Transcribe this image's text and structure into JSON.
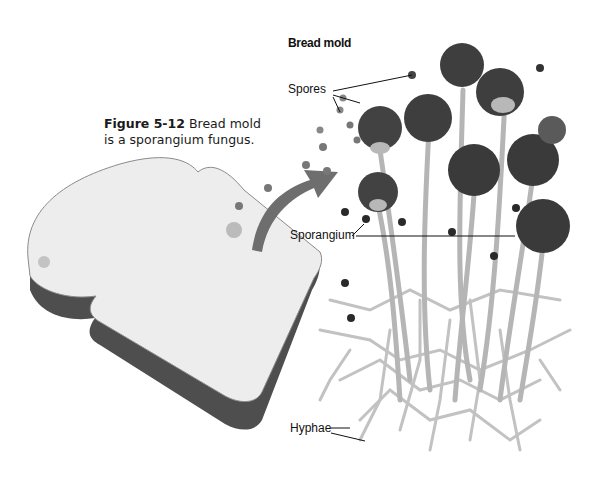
{
  "figure": {
    "number": "Figure 5-12",
    "caption": "Bread mold is a sporangium fungus.",
    "title": "Bread mold"
  },
  "labels": {
    "spores": "Spores",
    "sporangium": "Sporangium",
    "hyphae": "Hyphae"
  },
  "colors": {
    "bread_face": "#ededed",
    "crust": "#555555",
    "spore_dark": "#3a3a3a",
    "spore_mid": "#777777",
    "stalk": "#b5b5b5",
    "arrow": "#6e6e6e"
  }
}
